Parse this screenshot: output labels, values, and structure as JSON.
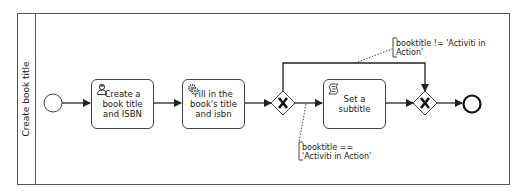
{
  "lane": {
    "title": "Create book title"
  },
  "tasks": [
    {
      "id": "task1",
      "icon": "user-icon",
      "label": "Create a book title and ISBN"
    },
    {
      "id": "task2",
      "icon": "gear-icon",
      "label": "Fill in the book's title and isbn"
    },
    {
      "id": "task3",
      "icon": "script-icon",
      "label": "Set a subtitle"
    }
  ],
  "gateways": [
    {
      "id": "gateway-split",
      "type": "exclusive",
      "symbol": "X"
    },
    {
      "id": "gateway-join",
      "type": "exclusive",
      "symbol": "X"
    }
  ],
  "annotations": {
    "default_flow_line1": "booktitle != 'Activiti in",
    "default_flow_line2": "Action'",
    "subtitle_flow_line1": "booktitle ==",
    "subtitle_flow_line2": "'Activiti in Action'"
  },
  "colors": {
    "stroke": "#222222",
    "lane_border": "#555555",
    "background": "#ffffff"
  }
}
